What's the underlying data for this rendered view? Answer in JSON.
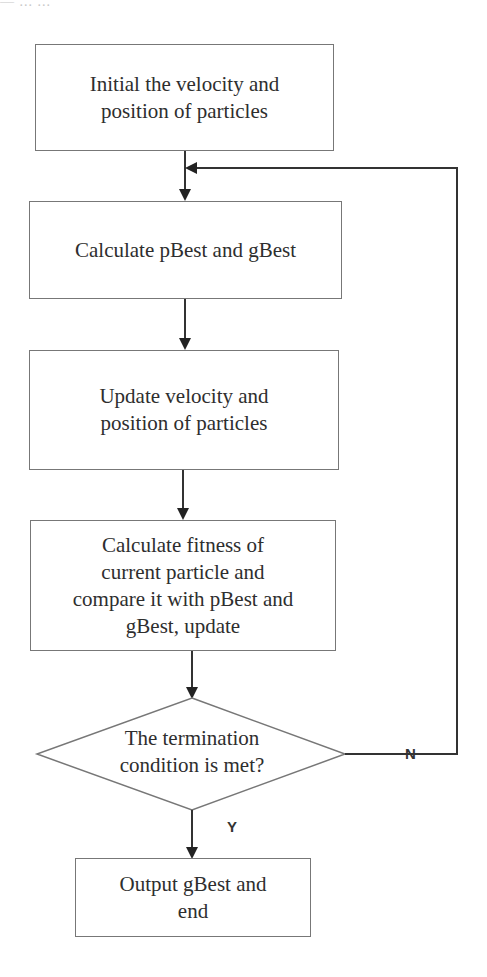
{
  "header_fragment": "— ... ...",
  "flowchart": {
    "nodes": [
      {
        "id": "init",
        "type": "process",
        "lines": [
          "Initial the velocity and",
          "position of particles"
        ]
      },
      {
        "id": "calc_best",
        "type": "process",
        "lines": [
          "Calculate pBest and gBest"
        ]
      },
      {
        "id": "update",
        "type": "process",
        "lines": [
          "Update velocity and",
          "position of particles"
        ]
      },
      {
        "id": "fitness",
        "type": "process",
        "lines": [
          "Calculate fitness of",
          "current particle and",
          "compare it with pBest and",
          "gBest, update"
        ]
      },
      {
        "id": "decision",
        "type": "decision",
        "lines": [
          "The termination",
          "condition is met?"
        ]
      },
      {
        "id": "output",
        "type": "process",
        "lines": [
          "Output gBest and",
          "end"
        ]
      }
    ],
    "edges": [
      {
        "from": "init",
        "to": "calc_best",
        "label": ""
      },
      {
        "from": "calc_best",
        "to": "update",
        "label": ""
      },
      {
        "from": "update",
        "to": "fitness",
        "label": ""
      },
      {
        "from": "fitness",
        "to": "decision",
        "label": ""
      },
      {
        "from": "decision",
        "to": "calc_best",
        "label": "N"
      },
      {
        "from": "decision",
        "to": "output",
        "label": "Y"
      }
    ],
    "labels": {
      "no": "N",
      "yes": "Y"
    }
  },
  "colors": {
    "line": "#333333",
    "border": "#777777",
    "text": "#2e2e2e"
  }
}
